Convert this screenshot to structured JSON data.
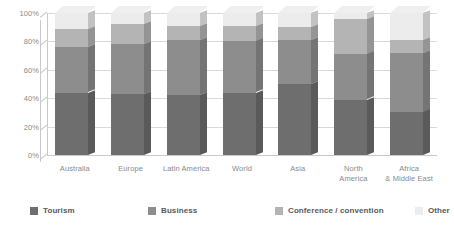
{
  "chart_data": {
    "type": "bar",
    "subtype": "stacked-100-percent-3d",
    "title": "",
    "xlabel": "",
    "ylabel": "",
    "ylim": [
      0,
      100
    ],
    "grid": true,
    "legend_position": "bottom",
    "categories": [
      "Australia",
      "Europe",
      "Latin America",
      "World",
      "Asia",
      "North America",
      "Africa & Middle East"
    ],
    "series": [
      {
        "name": "Tourism",
        "color": "#6e6e6e",
        "values": [
          44,
          43,
          42,
          44,
          50,
          39,
          30
        ]
      },
      {
        "name": "Business",
        "color": "#8d8d8d",
        "values": [
          32,
          35,
          39,
          36,
          31,
          32,
          42
        ]
      },
      {
        "name": "Conference / convention",
        "color": "#b4b4b4",
        "values": [
          13,
          14,
          10,
          11,
          9,
          25,
          9
        ]
      },
      {
        "name": "Other",
        "color": "#ececec",
        "values": [
          11,
          8,
          9,
          9,
          10,
          4,
          19
        ]
      }
    ],
    "y_ticks": [
      {
        "value": 0,
        "label": "0%"
      },
      {
        "value": 20,
        "label": "20%"
      },
      {
        "value": 40,
        "label": "40%"
      },
      {
        "value": 60,
        "label": "60%"
      },
      {
        "value": 80,
        "label": "80%"
      },
      {
        "value": 100,
        "label": "100%"
      }
    ],
    "legend": [
      {
        "label": "Tourism",
        "color": "#6e6e6e"
      },
      {
        "label": "Business",
        "color": "#8d8d8d"
      },
      {
        "label": "Conference / convention",
        "color": "#b4b4b4"
      },
      {
        "label": "Other",
        "color": "#ececec"
      }
    ]
  },
  "colors": {
    "background": "#ffffff",
    "gridline": "#d9d9d9",
    "axis_text": "#8a8a8a",
    "legend_text": "#595959",
    "tourism": "#6e6e6e",
    "business": "#8d8d8d",
    "conference": "#b4b4b4",
    "other": "#ececec"
  }
}
